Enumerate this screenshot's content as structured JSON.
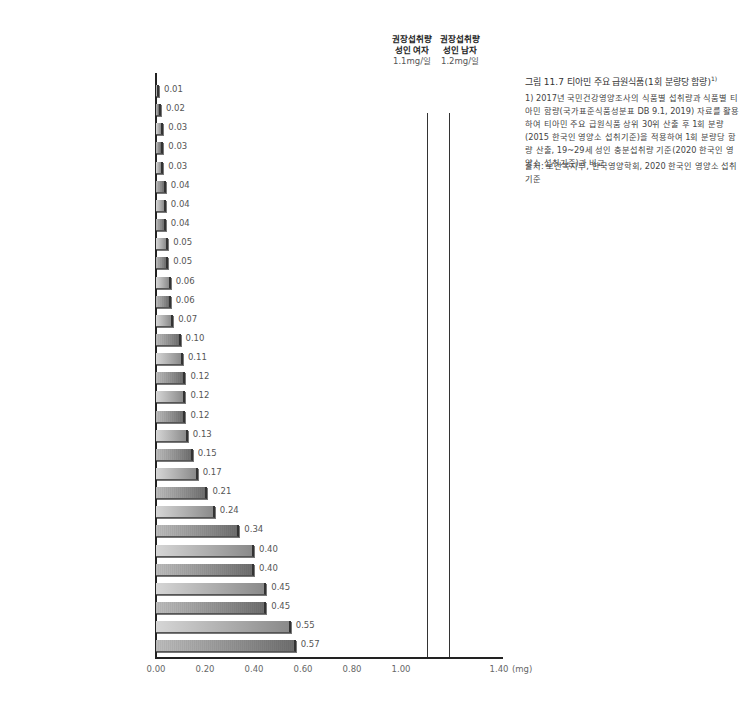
{
  "chart_data": {
    "type": "bar",
    "orientation": "horizontal",
    "title": "그림 11.7 티아민 주요 급원식품(1회 분량당 함량)",
    "title_footnote_mark": "1)",
    "xlabel": "(mg)",
    "ylabel": "",
    "xlim": [
      0,
      1.4
    ],
    "x_ticks": [
      "0.00",
      "0.20",
      "0.40",
      "0.60",
      "0.80",
      "1.00",
      "1.40"
    ],
    "grid": false,
    "categories": [
      "간장, 5g",
      "양파, 70g",
      "고추장, 5g",
      "소고기(살코기), 60g",
      "배추김치, 40g",
      "과자, 30g",
      "무, 70g",
      "우유, 200g",
      "달걀, 60g",
      "밀가루, 30g",
      "된장, 10g",
      "고구마, 70g",
      "백미, 90g",
      "다시마 육수, 200g",
      "시금치, 70g",
      "돼지 부산물(간), 45g",
      "국수, 210g",
      "닭고기, 60g",
      "라면(건면, 스프포함), 120g",
      "햄/소시지/베이컨, 30g",
      "빵, 100g",
      "보리, 90g",
      "현미, 90g",
      "옥수수, 70g",
      "장어, 60g",
      "돼지고기(살코기), 60g",
      "만두, 100g",
      "샌드위치/햄버거/피자, 150g",
      "시리얼, 30g",
      "순대, 100g"
    ],
    "values": [
      0.01,
      0.02,
      0.03,
      0.03,
      0.03,
      0.04,
      0.04,
      0.04,
      0.05,
      0.05,
      0.06,
      0.06,
      0.07,
      0.1,
      0.11,
      0.12,
      0.12,
      0.12,
      0.13,
      0.15,
      0.17,
      0.21,
      0.24,
      0.34,
      0.4,
      0.4,
      0.45,
      0.45,
      0.55,
      0.57
    ],
    "value_labels": [
      "0.01",
      "0.02",
      "0.03",
      "0.03",
      "0.03",
      "0.04",
      "0.04",
      "0.04",
      "0.05",
      "0.05",
      "0.06",
      "0.06",
      "0.07",
      "0.10",
      "0.11",
      "0.12",
      "0.12",
      "0.12",
      "0.13",
      "0.15",
      "0.17",
      "0.21",
      "0.24",
      "0.34",
      "0.40",
      "0.40",
      "0.45",
      "0.45",
      "0.55",
      "0.57"
    ],
    "reference_lines": [
      {
        "label_line1": "권장섭취량",
        "label_line2": "성인 여자",
        "label_line3": "1.1mg/일",
        "value": 1.1
      },
      {
        "label_line1": "권장섭취량",
        "label_line2": "성인 남자",
        "label_line3": "1.2mg/일",
        "value": 1.2
      }
    ],
    "colors": {
      "bar_light": "#c8c8c8",
      "bar_dark": "#8a8a8a",
      "axis": "#222222"
    }
  },
  "notes": {
    "footnote": "1) 2017년 국민건강영양조사의 식품별 섭취량과 식품별 티아민 함량(국가표준식품성분표 DB 9.1, 2019) 자료를 활용하여 티아민 주요 급원식품 상위 30위 산출 후 1회 분량(2015 한국인 영양소 섭취기준)을 적용하여 1회 분량당 함량 산출, 19~29세 성인 충분섭취량 기준(2020 한국인 영양소 섭취기준)과 비교",
    "source": "출처: 보건복지부, 한국영양학회, 2020 한국인 영양소 섭취기준"
  }
}
